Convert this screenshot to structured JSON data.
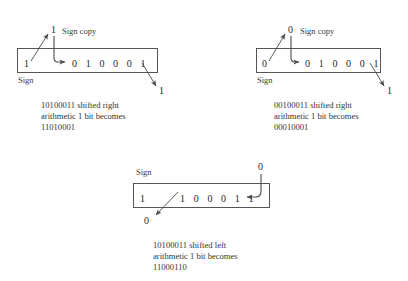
{
  "figure_kind": "arithmetic-shift-diagram",
  "panels": [
    {
      "id": "shift-right-negative",
      "sign_bit": "1",
      "sign_label": "Sign",
      "sign_copy_value": "1",
      "sign_copy_label": "Sign copy",
      "bits": "0 1 0 0 0 1",
      "out_bit": "1",
      "caption_line1": "10100011 shifted right",
      "caption_line2": "arithmetic 1 bit becomes",
      "caption_line3": "11010001"
    },
    {
      "id": "shift-right-positive",
      "sign_bit": "0",
      "sign_label": "Sign",
      "sign_copy_value": "0",
      "sign_copy_label": "Sign copy",
      "bits": "0 1 0 0 0 1",
      "out_bit": "1",
      "caption_line1": "00100011 shifted right",
      "caption_line2": "arithmetic 1 bit becomes",
      "caption_line3": "00010001"
    },
    {
      "id": "shift-left-negative",
      "sign_bit": "1",
      "sign_label": "Sign",
      "fill_in_value": "0",
      "bits": "1 0 0 0 1 1",
      "out_bit": "0",
      "caption_line1": "10100011 shifted left",
      "caption_line2": "arithmetic 1 bit becomes",
      "caption_line3": "11000110"
    }
  ],
  "colors": {
    "background": "#ffffff",
    "box_stroke": "#555555",
    "arrow_stroke": "#4a4a4a",
    "text": "#2b2b2b"
  }
}
